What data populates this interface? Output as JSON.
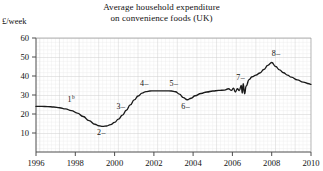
{
  "chart_data": {
    "type": "line",
    "title": "Average household expenditure on convenience foods (UK)",
    "title_lines": [
      "Average household expenditure",
      "on convenience foods (UK)"
    ],
    "ylabel": "£/week",
    "xlabel": "",
    "xlim": [
      1996,
      2010
    ],
    "ylim": [
      0,
      60
    ],
    "y_tick_labels": [
      "10",
      "20",
      "30",
      "40",
      "50",
      "60"
    ],
    "y_ticks": [
      10,
      20,
      30,
      40,
      50,
      60
    ],
    "x_tick_labels": [
      "1996",
      "1998",
      "2000",
      "2002",
      "2004",
      "2006",
      "2008",
      "2010"
    ],
    "x_ticks": [
      1996,
      1998,
      2000,
      2002,
      2004,
      2006,
      2008,
      2010
    ],
    "grid": "graph-paper minor grid, major every 5 minor",
    "legend": "none",
    "line_color": "#1a1a1a",
    "grid_color_minor": "#e2e2e2",
    "grid_color_major": "#cfcfcf",
    "axis_color": "#555555",
    "annotations": [
      {
        "label": "1",
        "superscript": "b",
        "leader": "",
        "x": 1997.6,
        "y": 26.5
      },
      {
        "label": "2",
        "superscript": "",
        "leader": "–",
        "x": 1999.1,
        "y": 9.0
      },
      {
        "label": "3",
        "superscript": "",
        "leader": "–",
        "x": 2000.1,
        "y": 22.5
      },
      {
        "label": "4",
        "superscript": "",
        "leader": "–",
        "x": 2001.3,
        "y": 34.6
      },
      {
        "label": "5",
        "superscript": "",
        "leader": "–",
        "x": 2002.8,
        "y": 34.6
      },
      {
        "label": "6",
        "superscript": "",
        "leader": "–",
        "x": 2003.4,
        "y": 22.4
      },
      {
        "label": "7",
        "superscript": "",
        "leader": "–",
        "x": 2006.2,
        "y": 38.0
      },
      {
        "label": "8",
        "superscript": "",
        "leader": "–",
        "x": 2008.0,
        "y": 50.6
      }
    ],
    "series": [
      {
        "name": "expenditure",
        "points": [
          [
            1996.0,
            24.0
          ],
          [
            1996.3,
            24.0
          ],
          [
            1996.6,
            23.9
          ],
          [
            1996.9,
            23.7
          ],
          [
            1997.2,
            23.3
          ],
          [
            1997.5,
            22.7
          ],
          [
            1997.8,
            21.8
          ],
          [
            1998.1,
            20.5
          ],
          [
            1998.4,
            18.7
          ],
          [
            1998.7,
            16.5
          ],
          [
            1999.0,
            14.6
          ],
          [
            1999.2,
            13.8
          ],
          [
            1999.4,
            13.5
          ],
          [
            1999.6,
            13.7
          ],
          [
            1999.8,
            14.4
          ],
          [
            2000.0,
            15.6
          ],
          [
            2000.2,
            17.3
          ],
          [
            2000.4,
            19.4
          ],
          [
            2000.6,
            22.0
          ],
          [
            2000.8,
            24.8
          ],
          [
            2001.0,
            27.4
          ],
          [
            2001.2,
            29.5
          ],
          [
            2001.4,
            31.0
          ],
          [
            2001.6,
            31.8
          ],
          [
            2001.8,
            32.1
          ],
          [
            2002.0,
            32.2
          ],
          [
            2002.3,
            32.2
          ],
          [
            2002.6,
            32.2
          ],
          [
            2002.9,
            32.1
          ],
          [
            2003.1,
            31.7
          ],
          [
            2003.3,
            30.5
          ],
          [
            2003.5,
            28.6
          ],
          [
            2003.7,
            27.5
          ],
          [
            2003.9,
            28.3
          ],
          [
            2004.1,
            29.6
          ],
          [
            2004.4,
            30.8
          ],
          [
            2004.7,
            31.6
          ],
          [
            2005.0,
            32.1
          ],
          [
            2005.3,
            32.4
          ],
          [
            2005.6,
            32.6
          ],
          [
            2005.8,
            33.3
          ],
          [
            2005.95,
            32.4
          ],
          [
            2006.05,
            33.6
          ],
          [
            2006.15,
            31.6
          ],
          [
            2006.25,
            33.3
          ],
          [
            2006.35,
            32.3
          ],
          [
            2006.45,
            35.1
          ],
          [
            2006.5,
            31.0
          ],
          [
            2006.55,
            35.9
          ],
          [
            2006.62,
            30.6
          ],
          [
            2006.7,
            34.8
          ],
          [
            2006.85,
            38.1
          ],
          [
            2007.0,
            39.6
          ],
          [
            2007.2,
            40.5
          ],
          [
            2007.4,
            41.6
          ],
          [
            2007.6,
            43.4
          ],
          [
            2007.8,
            45.6
          ],
          [
            2008.0,
            47.1
          ],
          [
            2008.2,
            45.0
          ],
          [
            2008.4,
            43.2
          ],
          [
            2008.6,
            41.7
          ],
          [
            2008.8,
            40.5
          ],
          [
            2009.0,
            39.4
          ],
          [
            2009.3,
            38.0
          ],
          [
            2009.6,
            36.8
          ],
          [
            2009.9,
            35.9
          ],
          [
            2010.0,
            35.6
          ]
        ]
      }
    ]
  }
}
